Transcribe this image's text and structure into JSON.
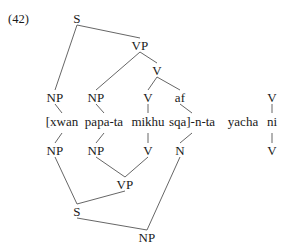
{
  "figure": {
    "example_number": "(42)",
    "type": "syntactic-tree-diagram",
    "width": 292,
    "height": 248,
    "line_color": "#555555",
    "text_color": "#1a1a1a"
  },
  "terminal_string": {
    "full": "[xwan papa-ta mikhu sqa]-n-ta yacha ni",
    "words": [
      {
        "text": "[xwan",
        "x": 62
      },
      {
        "text": "papa-ta",
        "x": 104
      },
      {
        "text": "mikhu",
        "x": 148
      },
      {
        "text": "sqa]-n-ta",
        "x": 192
      },
      {
        "text": "yacha",
        "x": 243
      },
      {
        "text": "ni",
        "x": 272
      }
    ]
  },
  "upper_tree": {
    "description": "Tree above the terminal string, root S at top",
    "nodes": [
      {
        "id": "S-top",
        "label": "S",
        "x": 77,
        "y": 18
      },
      {
        "id": "VP-top",
        "label": "VP",
        "x": 140,
        "y": 45
      },
      {
        "id": "V-top",
        "label": "V",
        "x": 157,
        "y": 70
      },
      {
        "id": "NP-u1",
        "label": "NP",
        "x": 55,
        "y": 97
      },
      {
        "id": "NP-u2",
        "label": "NP",
        "x": 96,
        "y": 97
      },
      {
        "id": "V-u1",
        "label": "V",
        "x": 148,
        "y": 97
      },
      {
        "id": "af-u1",
        "label": "af",
        "x": 180,
        "y": 97
      },
      {
        "id": "V-right-top",
        "label": "V",
        "x": 272,
        "y": 97
      }
    ],
    "edges": [
      {
        "from": "S-top",
        "to": "NP-u1"
      },
      {
        "from": "S-top",
        "to": "VP-top"
      },
      {
        "from": "VP-top",
        "to": "NP-u2"
      },
      {
        "from": "VP-top",
        "to": "V-top"
      },
      {
        "from": "V-top",
        "to": "V-u1"
      },
      {
        "from": "V-top",
        "to": "af-u1"
      }
    ],
    "terminal_stems": [
      {
        "from": "NP-u1",
        "word_index": 0
      },
      {
        "from": "NP-u2",
        "word_index": 1
      },
      {
        "from": "V-u1",
        "word_index": 2
      },
      {
        "from": "af-u1",
        "word_index": 3
      },
      {
        "from": "V-right-top",
        "word_index": 5
      }
    ]
  },
  "lower_tree": {
    "description": "Inverted tree below the terminal string, root NP at bottom",
    "nodes": [
      {
        "id": "NP-l1",
        "label": "NP",
        "x": 55,
        "y": 150
      },
      {
        "id": "NP-l2",
        "label": "NP",
        "x": 96,
        "y": 150
      },
      {
        "id": "V-l1",
        "label": "V",
        "x": 148,
        "y": 150
      },
      {
        "id": "N-l1",
        "label": "N",
        "x": 180,
        "y": 150
      },
      {
        "id": "VP-low",
        "label": "VP",
        "x": 125,
        "y": 184
      },
      {
        "id": "S-low",
        "label": "S",
        "x": 77,
        "y": 211
      },
      {
        "id": "NP-low",
        "label": "NP",
        "x": 147,
        "y": 237
      },
      {
        "id": "V-right-bottom",
        "label": "V",
        "x": 272,
        "y": 150
      }
    ],
    "edges": [
      {
        "from": "NP-l2",
        "to": "VP-low"
      },
      {
        "from": "V-l1",
        "to": "VP-low"
      },
      {
        "from": "NP-l1",
        "to": "S-low"
      },
      {
        "from": "VP-low",
        "to": "S-low"
      },
      {
        "from": "S-low",
        "to": "NP-low"
      },
      {
        "from": "N-l1",
        "to": "NP-low"
      }
    ],
    "terminal_stems": [
      {
        "to": "NP-l1",
        "word_index": 0
      },
      {
        "to": "NP-l2",
        "word_index": 1
      },
      {
        "to": "V-l1",
        "word_index": 2
      },
      {
        "to": "N-l1",
        "word_index": 3
      },
      {
        "to": "V-right-bottom",
        "word_index": 5
      }
    ]
  }
}
